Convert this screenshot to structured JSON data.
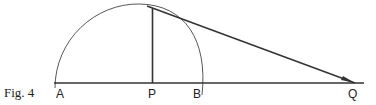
{
  "figure": {
    "caption": "Fig. 4",
    "labels": {
      "A": "A",
      "P": "P",
      "B": "B",
      "Q": "Q"
    },
    "colors": {
      "stroke": "#333333",
      "background": "#ffffff"
    }
  }
}
